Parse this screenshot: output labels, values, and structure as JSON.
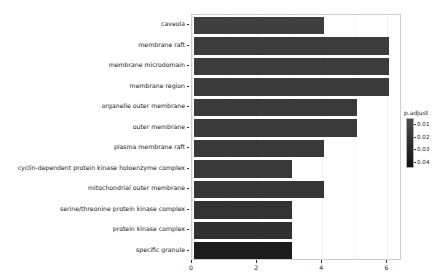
{
  "chart_data": {
    "type": "bar",
    "orientation": "horizontal",
    "title": "",
    "xlabel": "",
    "ylabel": "",
    "xlim": [
      0,
      6.45
    ],
    "xticks": [
      0,
      2,
      4,
      6
    ],
    "xticklabels": [
      "0",
      "2",
      "4",
      "6"
    ],
    "grid": true,
    "legend": {
      "title": "p.adjust",
      "position": "right",
      "type": "continuous-colorbar",
      "ticks": [
        0.01,
        0.02,
        0.03,
        0.04
      ],
      "ticklabels": [
        "0.01",
        "0.02",
        "0.03",
        "0.04"
      ],
      "range": [
        0.005,
        0.045
      ],
      "color_high": "#4a4a4a",
      "color_low": "#111111"
    },
    "categories": [
      "caveola",
      "membrane raft",
      "membrane microdomain",
      "membrane region",
      "organelle outer membrane",
      "outer membrane",
      "plasma membrane raft",
      "cyclin-dependent protein kinase holoenzyme complex",
      "mitochondrial outer membrane",
      "serine/threonine protein kinase complex",
      "protein kinase complex",
      "specific granule"
    ],
    "values": [
      4,
      6,
      6,
      6,
      5,
      5,
      4,
      3,
      4,
      3,
      3,
      3
    ],
    "bar_colors": [
      "#3e3e3e",
      "#3c3c3c",
      "#3c3c3c",
      "#3b3b3b",
      "#3a3a3a",
      "#3a3a3a",
      "#393939",
      "#383838",
      "#363636",
      "#333333",
      "#303030",
      "#1c1c1c"
    ],
    "padjust_values": [
      0.012,
      0.013,
      0.013,
      0.014,
      0.015,
      0.015,
      0.016,
      0.018,
      0.021,
      0.026,
      0.03,
      0.043
    ]
  }
}
